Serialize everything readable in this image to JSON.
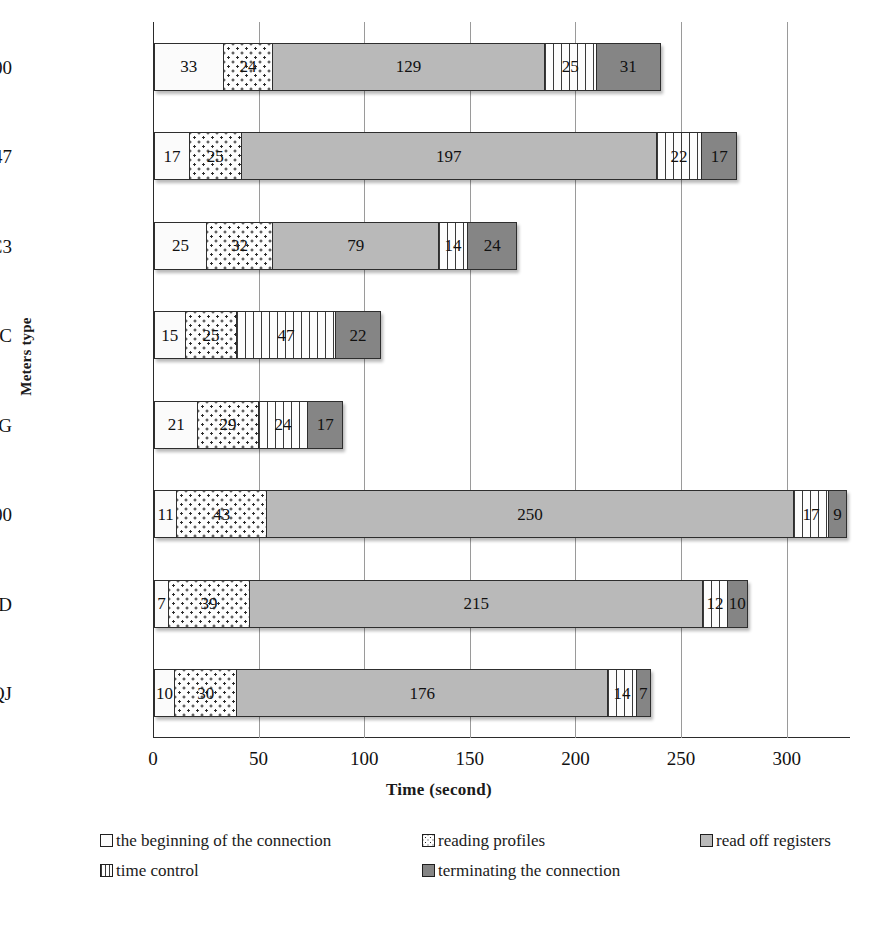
{
  "chart_data": {
    "type": "bar",
    "orientation": "horizontal",
    "stacked": true,
    "title": "",
    "xlabel": "Time (second)",
    "ylabel": "Meters type",
    "xlim": [
      0,
      330
    ],
    "xticks": [
      0,
      50,
      100,
      150,
      200,
      250,
      300
    ],
    "grid": true,
    "legend_position": "bottom",
    "categories": [
      "E700",
      "EKM647",
      "DC3",
      "FBC",
      "FAG",
      "SL7000",
      "ZxD",
      "LZQJ"
    ],
    "series": [
      {
        "name": "the beginning of the connection",
        "key": "begin",
        "color": "#fbfbfb",
        "pattern": "solid-white",
        "values": [
          33,
          17,
          25,
          15,
          21,
          11,
          7,
          10
        ]
      },
      {
        "name": "reading profiles",
        "key": "profiles",
        "color": "#fdfdfd",
        "pattern": "dotted",
        "values": [
          24,
          25,
          32,
          25,
          29,
          43,
          39,
          30
        ]
      },
      {
        "name": "read off registers",
        "key": "registers",
        "color": "#b9b9b9",
        "pattern": "solid-gray",
        "values": [
          129,
          197,
          79,
          0,
          0,
          250,
          215,
          176
        ]
      },
      {
        "name": "time control",
        "key": "timectl",
        "color": "#fdfdfd",
        "pattern": "vertical-stripes",
        "values": [
          25,
          22,
          14,
          47,
          24,
          17,
          12,
          14
        ]
      },
      {
        "name": "terminating the connection",
        "key": "terminate",
        "color": "#858585",
        "pattern": "solid-darkgray",
        "values": [
          31,
          17,
          24,
          22,
          17,
          9,
          10,
          7
        ]
      }
    ],
    "totals": [
      242,
      278,
      174,
      109,
      91,
      330,
      283,
      237
    ]
  },
  "axes": {
    "y_title": "Meters type",
    "x_title": "Time (second)",
    "x_tick_labels": [
      "0",
      "50",
      "100",
      "150",
      "200",
      "250",
      "300"
    ],
    "category_labels": [
      "E700",
      "EKM647",
      "DC3",
      "FBC",
      "FAG",
      "SL7000",
      "ZxD",
      "LZQJ"
    ]
  },
  "legend": {
    "items": [
      {
        "label": "the beginning of the connection",
        "key": "begin"
      },
      {
        "label": "reading profiles",
        "key": "profiles"
      },
      {
        "label": "read off registers",
        "key": "registers"
      },
      {
        "label": "time control",
        "key": "timectl"
      },
      {
        "label": "terminating the connection",
        "key": "terminate"
      }
    ]
  }
}
